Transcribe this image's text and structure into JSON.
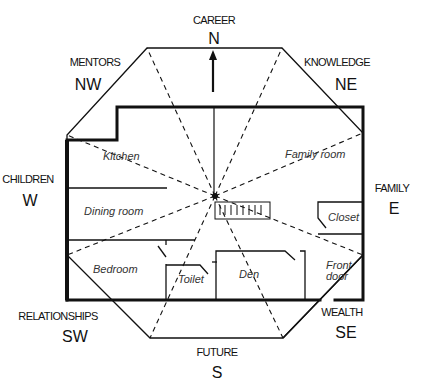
{
  "diagram": {
    "type": "feng-shui-bagua-floor-plan",
    "center_marker": "star-point",
    "compass": [
      {
        "area": "CAREER",
        "direction": "N"
      },
      {
        "area": "KNOWLEDGE",
        "direction": "NE"
      },
      {
        "area": "FAMILY",
        "direction": "E"
      },
      {
        "area": "WEALTH",
        "direction": "SE"
      },
      {
        "area": "FUTURE",
        "direction": "S"
      },
      {
        "area": "RELATIONSHIPS",
        "direction": "SW"
      },
      {
        "area": "CHILDREN",
        "direction": "W"
      },
      {
        "area": "MENTORS",
        "direction": "NW"
      }
    ],
    "rooms": [
      {
        "label": "Kitchen"
      },
      {
        "label": "Family room"
      },
      {
        "label": "Dining room"
      },
      {
        "label": "Closet"
      },
      {
        "label": "Bedroom"
      },
      {
        "label": "Toilet"
      },
      {
        "label": "Den"
      },
      {
        "label": "Front door"
      }
    ],
    "colors": {
      "line": "#111111",
      "background": "#ffffff"
    }
  }
}
